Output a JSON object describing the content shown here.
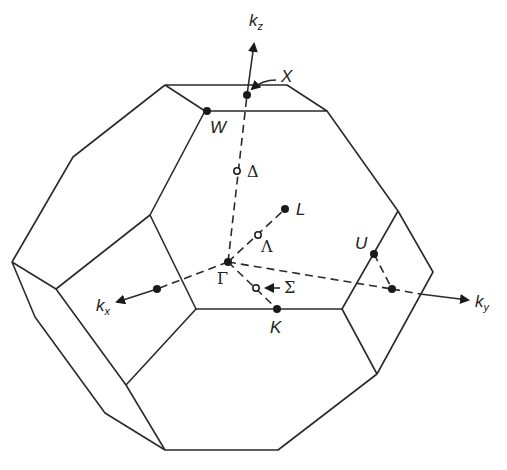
{
  "diagram": {
    "axes": {
      "kz": {
        "label": "k",
        "sub": "z"
      },
      "kx": {
        "label": "k",
        "sub": "x"
      },
      "ky": {
        "label": "k",
        "sub": "y"
      }
    },
    "high_symmetry_points": {
      "X": "X",
      "W": "W",
      "L": "L",
      "U": "U",
      "K": "K",
      "Gamma": "Γ"
    },
    "lines": {
      "Delta": "Δ",
      "Lambda": "Λ",
      "Sigma": "Σ"
    },
    "colors": {
      "stroke": "#2a2a2a",
      "background": "#ffffff"
    }
  }
}
